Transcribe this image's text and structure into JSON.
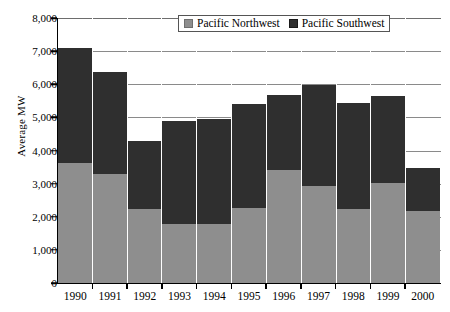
{
  "chart_data": {
    "type": "bar",
    "subtype": "stacked-vertical",
    "title": "",
    "xlabel": "",
    "ylabel": "Average MW",
    "ylim": [
      0,
      8000
    ],
    "ytick_step": 1000,
    "ytick_labels": [
      "8,000",
      "7,000",
      "6,000",
      "5,000",
      "4,000",
      "3,000",
      "2,000",
      "1,000",
      "0"
    ],
    "ytick_values": [
      8000,
      7000,
      6000,
      5000,
      4000,
      3000,
      2000,
      1000,
      0
    ],
    "grid": "horizontal",
    "legend_position": "top-center",
    "categories": [
      "1990",
      "1991",
      "1992",
      "1993",
      "1994",
      "1995",
      "1996",
      "1997",
      "1998",
      "1999",
      "2000"
    ],
    "series": [
      {
        "name": "Pacific Northwest",
        "color": "#8e8e8e",
        "values": [
          3620,
          3290,
          2220,
          1780,
          1780,
          2270,
          3400,
          2920,
          2220,
          3020,
          2180
        ]
      },
      {
        "name": "Pacific Southwest",
        "color": "#2f2f2f",
        "values": [
          3480,
          3070,
          2080,
          3110,
          3170,
          3130,
          2270,
          3050,
          3210,
          2630,
          1290
        ]
      }
    ],
    "totals": [
      7100,
      6360,
      4300,
      4890,
      4950,
      5400,
      5670,
      5970,
      5430,
      5650,
      3470
    ]
  },
  "legend": {
    "entries": [
      {
        "label": "Pacific Northwest",
        "swatch": "north"
      },
      {
        "label": "Pacific Southwest",
        "swatch": "south"
      }
    ]
  }
}
